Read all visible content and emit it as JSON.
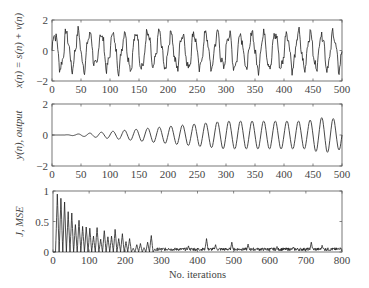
{
  "chart_data": [
    {
      "type": "line",
      "title": "",
      "xlabel": "",
      "ylabel": "x(n) = s(n) + v(n)",
      "xlim": [
        0,
        500
      ],
      "ylim": [
        -2,
        2
      ],
      "xticks": [
        0,
        50,
        100,
        150,
        200,
        250,
        300,
        350,
        400,
        450,
        500
      ],
      "yticks": [
        -2,
        0,
        2
      ],
      "description": "Noisy sinusoid, period ~20 samples, amplitude ~1.2 with additive noise",
      "signal": {
        "period": 20,
        "amplitude": 1.15,
        "noise_amplitude": 0.3
      },
      "series": [
        {
          "name": "x(n)",
          "color": "#222222"
        }
      ]
    },
    {
      "type": "line",
      "title": "",
      "xlabel": "",
      "ylabel": "y(n), output",
      "xlim": [
        0,
        500
      ],
      "ylim": [
        -2,
        2
      ],
      "xticks": [
        0,
        50,
        100,
        150,
        200,
        250,
        300,
        350,
        400,
        450,
        500
      ],
      "yticks": [
        -2,
        0,
        2
      ],
      "description": "Adaptive filter output: sinusoid starting at 0 and growing in amplitude to ~1 by n=300",
      "signal": {
        "period": 20,
        "start": 20,
        "final_amplitude": 0.9,
        "settle_n": 300
      },
      "series": [
        {
          "name": "y(n)",
          "color": "#333333"
        }
      ]
    },
    {
      "type": "line",
      "title": "",
      "xlabel": "No. iterations",
      "ylabel": "J, MSE",
      "xlim": [
        0,
        800
      ],
      "ylim": [
        0,
        1
      ],
      "xticks": [
        0,
        100,
        200,
        300,
        400,
        500,
        600,
        700,
        800
      ],
      "yticks": [
        0,
        0.5,
        1
      ],
      "description": "Learning curve: oscillating MSE decaying from ~0.95 to ~0.05 by n≈290, with small spikes afterwards",
      "peaks": [
        {
          "x": 12,
          "y": 0.95
        },
        {
          "x": 22,
          "y": 0.88
        },
        {
          "x": 32,
          "y": 0.82
        },
        {
          "x": 42,
          "y": 0.66
        },
        {
          "x": 52,
          "y": 0.64
        },
        {
          "x": 62,
          "y": 0.45
        },
        {
          "x": 72,
          "y": 0.52
        },
        {
          "x": 82,
          "y": 0.42
        },
        {
          "x": 92,
          "y": 0.41
        },
        {
          "x": 102,
          "y": 0.39
        },
        {
          "x": 112,
          "y": 0.26
        },
        {
          "x": 122,
          "y": 0.4
        },
        {
          "x": 132,
          "y": 0.21
        },
        {
          "x": 142,
          "y": 0.35
        },
        {
          "x": 152,
          "y": 0.25
        },
        {
          "x": 162,
          "y": 0.26
        },
        {
          "x": 172,
          "y": 0.37
        },
        {
          "x": 182,
          "y": 0.22
        },
        {
          "x": 192,
          "y": 0.3
        },
        {
          "x": 202,
          "y": 0.17
        },
        {
          "x": 212,
          "y": 0.22
        },
        {
          "x": 222,
          "y": 0.06
        },
        {
          "x": 232,
          "y": 0.12
        },
        {
          "x": 242,
          "y": 0.14
        },
        {
          "x": 252,
          "y": 0.07
        },
        {
          "x": 262,
          "y": 0.16
        },
        {
          "x": 272,
          "y": 0.27
        },
        {
          "x": 282,
          "y": 0.05
        },
        {
          "x": 320,
          "y": 0.06
        },
        {
          "x": 375,
          "y": 0.1
        },
        {
          "x": 425,
          "y": 0.22
        },
        {
          "x": 450,
          "y": 0.12
        },
        {
          "x": 495,
          "y": 0.16
        },
        {
          "x": 540,
          "y": 0.13
        },
        {
          "x": 565,
          "y": 0.06
        },
        {
          "x": 620,
          "y": 0.09
        },
        {
          "x": 665,
          "y": 0.08
        },
        {
          "x": 715,
          "y": 0.16
        },
        {
          "x": 745,
          "y": 0.11
        },
        {
          "x": 795,
          "y": 0.07
        }
      ],
      "series": [
        {
          "name": "J",
          "color": "#222222"
        }
      ]
    }
  ]
}
